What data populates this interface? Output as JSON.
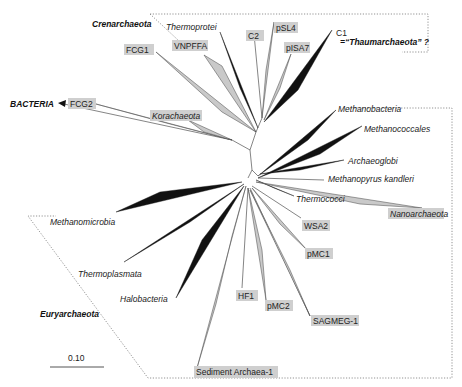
{
  "figure": {
    "type": "unrooted phylogenetic tree (Archaea)",
    "scale_bar": {
      "label": "0.10"
    },
    "outgroup": {
      "label": "BACTERIA"
    },
    "groups": {
      "crenarchaeota": "Crenarchaeota",
      "euryarchaeota": "Euryarchaeota",
      "thaum_c1": "C1",
      "thaum_note": "=“Thaumarchaeota” ?"
    },
    "taxa": {
      "thermoprotei": "Thermoprotei",
      "vnpffa": "VNPFFA",
      "c2": "C2",
      "psl4": "pSL4",
      "pisa7": "pISA7",
      "fcg1": "FCG1",
      "fcg2": "FCG2",
      "korachaeota": "Korachaeota",
      "methanobacteria": "Methanobacteria",
      "methanococcales": "Methanococcales",
      "archaeoglobi": "Archaeoglobi",
      "methanopyrus": "Methanopyrus kandleri",
      "thermococci": "Thermococci",
      "nanoarchaeota": "Nanoarchaeota",
      "wsa2": "WSA2",
      "pmc1": "pMC1",
      "methanomicrobia": "Methanomicrobia",
      "thermoplasmata": "Thermoplasmata",
      "halobacteria": "Halobacteria",
      "hf1": "HF1",
      "pmc2": "pMC2",
      "sagmeg1": "SAGMEG-1",
      "sediment": "Sediment Archaea-1"
    },
    "legend": {
      "black_wedge": "cultured lineage",
      "grey_box": "uncultured / environmental lineage"
    }
  }
}
